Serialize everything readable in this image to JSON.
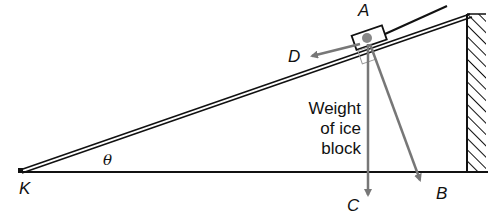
{
  "diagram": {
    "labels": {
      "point_a": "A",
      "point_b": "B",
      "point_c": "C",
      "point_d": "D",
      "point_k": "K",
      "angle": "θ"
    },
    "weight_label": {
      "line1": "Weight",
      "line2": "of ice",
      "line3": "block"
    },
    "colors": {
      "line": "#111111",
      "arrow": "#777777",
      "background": "#ffffff"
    }
  }
}
